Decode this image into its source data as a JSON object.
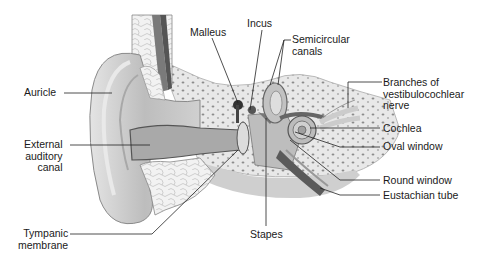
{
  "diagram": {
    "labels": {
      "auricle": "Auricle",
      "external_canal": [
        "External",
        "auditory",
        "canal"
      ],
      "tympanic": [
        "Tympanic",
        "membrane"
      ],
      "malleus": "Malleus",
      "incus": "Incus",
      "semicircular": [
        "Semicircular",
        "canals"
      ],
      "nerve": [
        "Branches of",
        "vestibulocochlear",
        "nerve"
      ],
      "cochlea": "Cochlea",
      "oval_window": "Oval window",
      "round_window": "Round window",
      "eustachian": "Eustachian tube",
      "stapes": "Stapes"
    },
    "colors": {
      "skin": "#d4d4d4",
      "skin_dark": "#9a9a9a",
      "bone": "#e6e6e6",
      "bone_spots": "#8c8c8c",
      "canal": "#a9a9a9",
      "vessel": "#5a5a5a",
      "line": "#222222"
    }
  }
}
